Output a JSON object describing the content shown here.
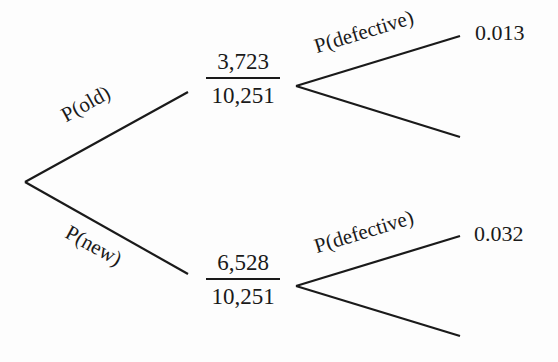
{
  "tree": {
    "root_branches": [
      {
        "label": "P(old)",
        "numerator": "3,723",
        "denominator": "10,251",
        "sub_branches": [
          {
            "label": "P(defective)",
            "value": "0.013"
          },
          {
            "label": "",
            "value": ""
          }
        ]
      },
      {
        "label": "P(new)",
        "numerator": "6,528",
        "denominator": "10,251",
        "sub_branches": [
          {
            "label": "P(defective)",
            "value": "0.032"
          },
          {
            "label": "",
            "value": ""
          }
        ]
      }
    ]
  },
  "colors": {
    "line": "#1a1a1a",
    "background": "#fdfdfd"
  }
}
